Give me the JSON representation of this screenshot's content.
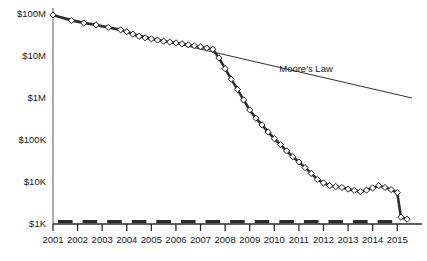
{
  "chart_data": {
    "type": "line",
    "title": "",
    "subtitle": "",
    "xlabel": "",
    "ylabel": "",
    "yscale": "log",
    "ylim": [
      1000,
      100000000
    ],
    "xlim": [
      2001,
      2015.6
    ],
    "grid": false,
    "legend_position": "none",
    "ytick_labels": [
      "$100M",
      "$10M",
      "$1M",
      "$100K",
      "$10K",
      "$1K"
    ],
    "ytick_values": [
      100000000,
      10000000,
      1000000,
      100000,
      10000,
      1000
    ],
    "xtick_labels": [
      "2001",
      "2002",
      "2003",
      "2004",
      "2005",
      "2006",
      "2007",
      "2008",
      "2009",
      "2010",
      "2011",
      "2012",
      "2013",
      "2014",
      "2015"
    ],
    "xtick_values": [
      2001,
      2002,
      2003,
      2004,
      2005,
      2006,
      2007,
      2008,
      2009,
      2010,
      2011,
      2012,
      2013,
      2014,
      2015
    ],
    "annotations": [
      {
        "text": "Moore's Law",
        "x": 2010.2,
        "y": 4200000
      }
    ],
    "series": [
      {
        "name": "Cost",
        "marker": "diamond",
        "points": [
          [
            2001.0,
            95000000
          ],
          [
            2001.75,
            70000000
          ],
          [
            2002.25,
            61000000
          ],
          [
            2002.75,
            55000000
          ],
          [
            2003.25,
            48000000
          ],
          [
            2003.75,
            42000000
          ],
          [
            2004.0,
            38000000
          ],
          [
            2004.25,
            33000000
          ],
          [
            2004.5,
            29500000
          ],
          [
            2004.75,
            27000000
          ],
          [
            2005.0,
            25500000
          ],
          [
            2005.25,
            24000000
          ],
          [
            2005.5,
            22500000
          ],
          [
            2005.75,
            21500000
          ],
          [
            2006.0,
            20500000
          ],
          [
            2006.25,
            19500000
          ],
          [
            2006.5,
            18500000
          ],
          [
            2006.75,
            17500000
          ],
          [
            2007.0,
            16500000
          ],
          [
            2007.25,
            15500000
          ],
          [
            2007.5,
            14500000
          ],
          [
            2007.75,
            9000000
          ],
          [
            2008.0,
            5000000
          ],
          [
            2008.25,
            2800000
          ],
          [
            2008.5,
            1600000
          ],
          [
            2008.75,
            900000
          ],
          [
            2009.0,
            520000
          ],
          [
            2009.25,
            330000
          ],
          [
            2009.5,
            230000
          ],
          [
            2009.75,
            155000
          ],
          [
            2010.0,
            108000
          ],
          [
            2010.25,
            78000
          ],
          [
            2010.5,
            55000
          ],
          [
            2010.75,
            40000
          ],
          [
            2011.0,
            30000
          ],
          [
            2011.25,
            22000
          ],
          [
            2011.5,
            16000
          ],
          [
            2011.75,
            11500
          ],
          [
            2012.0,
            9500
          ],
          [
            2012.25,
            8200
          ],
          [
            2012.5,
            7800
          ],
          [
            2012.75,
            7400
          ],
          [
            2013.0,
            6800
          ],
          [
            2013.25,
            6300
          ],
          [
            2013.5,
            5900
          ],
          [
            2013.75,
            6400
          ],
          [
            2014.0,
            7200
          ],
          [
            2014.25,
            8200
          ],
          [
            2014.5,
            7400
          ],
          [
            2014.75,
            6600
          ],
          [
            2015.0,
            5600
          ],
          [
            2015.15,
            1450
          ],
          [
            2015.4,
            1300
          ]
        ]
      },
      {
        "name": "Moore's Law",
        "marker": "none",
        "points": [
          [
            2001.0,
            95000000
          ],
          [
            2015.6,
            1000000
          ]
        ]
      }
    ]
  }
}
